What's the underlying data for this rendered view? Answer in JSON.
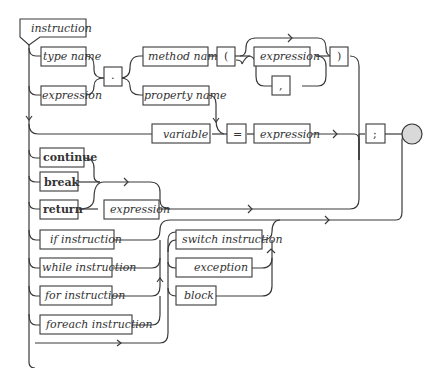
{
  "diagram": {
    "title": "instruction",
    "type": "railroad-syntax-diagram",
    "nodes": {
      "type_name": "type name",
      "expression_head": "expression",
      "dot": ".",
      "method_name": "method name",
      "open_paren": "(",
      "arg_expression": "expression",
      "comma": ",",
      "close_paren": ")",
      "property_name": "property name",
      "variable": "variable",
      "equals": "=",
      "assign_expression": "expression",
      "semicolon": ";",
      "continue": "continue",
      "break": "break",
      "return": "return",
      "return_expression": "expression",
      "if_instruction": "if instruction",
      "while_instruction": "while instruction",
      "for_instruction": "for instruction",
      "foreach_instruction": "foreach instruction",
      "switch_instruction": "switch instruction",
      "exception": "exception",
      "block": "block"
    },
    "colors": {
      "line": "#3a3a3a",
      "box_fill": "#ffffff",
      "end_node": "#d9d9d9"
    }
  }
}
